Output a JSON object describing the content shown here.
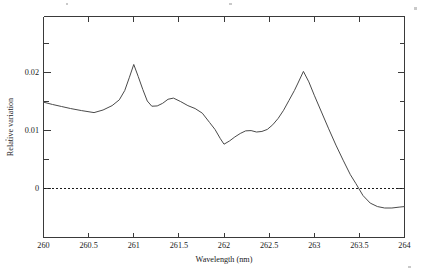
{
  "chart_data": {
    "type": "line",
    "title": "",
    "xlabel": "Wavelength (nm)",
    "ylabel": "Relative variation",
    "xlim": [
      260,
      264
    ],
    "ylim": [
      -0.0084,
      0.0297
    ],
    "grid": false,
    "legend": null,
    "xticks": [
      "260",
      "260.5",
      "261",
      "261.5",
      "262",
      "262.5",
      "263",
      "263.5",
      "264"
    ],
    "xtick_values": [
      260,
      260.5,
      261,
      261.5,
      262,
      262.5,
      263,
      263.5,
      264
    ],
    "yticks": [
      "0",
      "0.01",
      "0.02"
    ],
    "ytick_values": [
      0,
      0.01,
      0.02
    ],
    "yticks_minor": [
      0.005,
      0.015,
      0.025
    ],
    "annotations": [
      {
        "name": "zero-reference-line",
        "type": "hline",
        "y": 0,
        "style": "dashed"
      }
    ],
    "series": [
      {
        "name": "Relative variation",
        "color": "#4a4a4a",
        "x": [
          260.0,
          260.1,
          260.2,
          260.3,
          260.42,
          260.56,
          260.66,
          260.76,
          260.84,
          260.9,
          260.95,
          261.0,
          261.05,
          261.1,
          261.15,
          261.2,
          261.26,
          261.32,
          261.38,
          261.44,
          261.52,
          261.6,
          261.68,
          261.76,
          261.84,
          261.9,
          261.96,
          262.0,
          262.06,
          262.12,
          262.18,
          262.24,
          262.3,
          262.36,
          262.42,
          262.48,
          262.54,
          262.6,
          262.66,
          262.72,
          262.78,
          262.82,
          262.88,
          262.94,
          263.0,
          263.08,
          263.16,
          263.24,
          263.32,
          263.4,
          263.46,
          263.54,
          263.62,
          263.7,
          263.78,
          263.86,
          263.94,
          264.0
        ],
        "y": [
          0.0148,
          0.0144,
          0.01405,
          0.0137,
          0.01335,
          0.013,
          0.01345,
          0.0142,
          0.0152,
          0.0168,
          0.019,
          0.0213,
          0.0192,
          0.017,
          0.015,
          0.0141,
          0.01415,
          0.0146,
          0.0153,
          0.0155,
          0.0149,
          0.0142,
          0.0137,
          0.0129,
          0.0113,
          0.0101,
          0.0085,
          0.00755,
          0.0081,
          0.0088,
          0.0094,
          0.00985,
          0.0099,
          0.00965,
          0.00975,
          0.0101,
          0.0109,
          0.012,
          0.0134,
          0.0151,
          0.0168,
          0.0181,
          0.0201,
          0.0183,
          0.016,
          0.0131,
          0.0102,
          0.0074,
          0.0048,
          0.0023,
          0.0008,
          -0.0013,
          -0.0026,
          -0.0032,
          -0.00345,
          -0.00345,
          -0.0033,
          -0.0032
        ]
      }
    ]
  },
  "axes": {
    "x_title": "Wavelength (nm)",
    "y_title": "Relative variation"
  }
}
